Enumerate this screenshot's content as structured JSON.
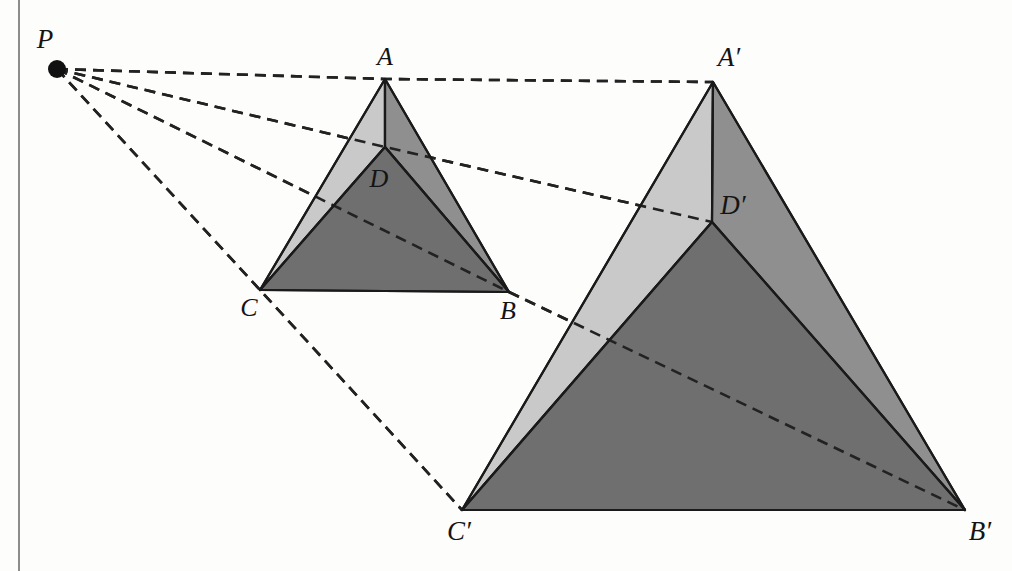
{
  "figure": {
    "background_color": "#fdfdfc",
    "margin_rule_color": "#8c8c8c",
    "stroke_color": "#1a1a1a",
    "dash_color": "#222222",
    "center_point": {
      "name": "P",
      "label": "P",
      "x": 57,
      "y": 69,
      "radius": 9
    },
    "labels": {
      "A": "A",
      "B": "B",
      "C": "C",
      "D": "D",
      "A_prime": "A′",
      "B_prime": "B′",
      "C_prime": "C′",
      "D_prime": "D′",
      "P": "P"
    },
    "palette": {
      "face_light": "#c9c9c9",
      "face_medium": "#8f8f8f",
      "face_dark": "#6f6f6f",
      "edge": "#1a1a1a"
    },
    "preimage": {
      "name": "tetrahedron-ABCD",
      "vertices": {
        "A": {
          "x": 385,
          "y": 79
        },
        "B": {
          "x": 509,
          "y": 292
        },
        "C": {
          "x": 260,
          "y": 290
        },
        "D": {
          "x": 385,
          "y": 147
        }
      },
      "label_positions": {
        "A": {
          "x": 385,
          "y": 59,
          "anchor": "middle"
        },
        "B": {
          "x": 508,
          "y": 313,
          "anchor": "middle"
        },
        "C": {
          "x": 249,
          "y": 310,
          "anchor": "middle"
        },
        "D": {
          "x": 379,
          "y": 181,
          "anchor": "middle"
        }
      },
      "faces": [
        {
          "name": "face-ACD-left",
          "points": "385,79 260,290 385,147",
          "fill": "#c9c9c9"
        },
        {
          "name": "face-ABD-right",
          "points": "385,79 509,292 385,147",
          "fill": "#8f8f8f"
        },
        {
          "name": "face-BCD-front",
          "points": "260,290 509,292 385,147",
          "fill": "#6f6f6f"
        }
      ],
      "edges": [
        {
          "name": "edge-AC",
          "x1": 385,
          "y1": 79,
          "x2": 260,
          "y2": 290
        },
        {
          "name": "edge-AB",
          "x1": 385,
          "y1": 79,
          "x2": 509,
          "y2": 292
        },
        {
          "name": "edge-CB",
          "x1": 260,
          "y1": 290,
          "x2": 509,
          "y2": 292
        },
        {
          "name": "edge-AD",
          "x1": 385,
          "y1": 79,
          "x2": 385,
          "y2": 147
        },
        {
          "name": "edge-DC",
          "x1": 385,
          "y1": 147,
          "x2": 260,
          "y2": 290
        },
        {
          "name": "edge-DB",
          "x1": 385,
          "y1": 147,
          "x2": 509,
          "y2": 292
        }
      ]
    },
    "image": {
      "name": "tetrahedron-A-prime-B-prime-C-prime-D-prime",
      "vertices": {
        "A_prime": {
          "x": 713,
          "y": 82
        },
        "B_prime": {
          "x": 965,
          "y": 510
        },
        "C_prime": {
          "x": 462,
          "y": 510
        },
        "D_prime": {
          "x": 712,
          "y": 222
        }
      },
      "label_positions": {
        "A_prime": {
          "x": 729,
          "y": 60,
          "anchor": "middle"
        },
        "B_prime": {
          "x": 980,
          "y": 534,
          "anchor": "middle"
        },
        "C_prime": {
          "x": 459,
          "y": 534,
          "anchor": "middle"
        },
        "D_prime": {
          "x": 733,
          "y": 208,
          "anchor": "middle"
        }
      },
      "faces": [
        {
          "name": "face-ApCpDp-left",
          "points": "713,82 462,510 712,222",
          "fill": "#c9c9c9"
        },
        {
          "name": "face-ApBpDp-right",
          "points": "713,82 965,510 712,222",
          "fill": "#8f8f8f"
        },
        {
          "name": "face-BpCpDp-front",
          "points": "462,510 965,510 712,222",
          "fill": "#6f6f6f"
        }
      ],
      "edges": [
        {
          "name": "edge-ApCp",
          "x1": 713,
          "y1": 82,
          "x2": 462,
          "y2": 510
        },
        {
          "name": "edge-ApBp",
          "x1": 713,
          "y1": 82,
          "x2": 965,
          "y2": 510
        },
        {
          "name": "edge-CpBp",
          "x1": 462,
          "y1": 510,
          "x2": 965,
          "y2": 510
        },
        {
          "name": "edge-ApDp",
          "x1": 713,
          "y1": 82,
          "x2": 712,
          "y2": 222
        },
        {
          "name": "edge-DpCp",
          "x1": 712,
          "y1": 222,
          "x2": 462,
          "y2": 510
        },
        {
          "name": "edge-DpBp",
          "x1": 712,
          "y1": 222,
          "x2": 965,
          "y2": 510
        }
      ]
    },
    "projection_rays": [
      {
        "name": "ray-P-A-Aprime",
        "from": "P",
        "through": "A",
        "to": "A_prime",
        "points": "57,69 385,79 713,82"
      },
      {
        "name": "ray-P-D-Dprime",
        "from": "P",
        "through": "D",
        "to": "D_prime",
        "points": "57,69 385,147 712,222"
      },
      {
        "name": "ray-P-B-Bprime",
        "from": "P",
        "through": "B",
        "to": "B_prime",
        "points": "57,69 509,292 965,510"
      },
      {
        "name": "ray-P-C-Cprime",
        "from": "P",
        "through": "C",
        "to": "C_prime",
        "points": "57,69 260,290 462,510"
      }
    ],
    "dash_pattern": "11 7",
    "dash_width": 2.6,
    "edge_width": 2.2,
    "margin_rule": {
      "x": 19,
      "y1": 0,
      "y2": 571,
      "width": 2
    }
  }
}
